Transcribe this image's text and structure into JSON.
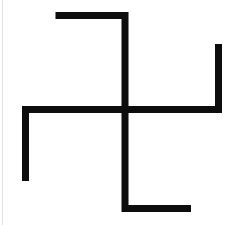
{
  "canvas": {
    "width": 233,
    "height": 225,
    "background_color": "#ffffff",
    "title": "Swastika Symbol"
  },
  "symbol": {
    "name": "swastika",
    "orientation": "left-facing",
    "description": "Four-armed geometric cross symbol with bent arms",
    "stroke_color": "#0d0d0d",
    "stroke_width": 7,
    "center": {
      "x": 125,
      "y": 109.5
    },
    "arms": [
      {
        "id": "top-arm",
        "label": "Top arm bending left",
        "points": "125,109.5 125,15.5 55.5,15.5"
      },
      {
        "id": "right-arm",
        "label": "Right arm bending up",
        "points": "125,109.5 218.5,109.5 218.5,44"
      },
      {
        "id": "bottom-arm",
        "label": "Bottom arm bending right",
        "points": "125,109.5 125,208.5 191,208.5"
      },
      {
        "id": "left-arm",
        "label": "Left arm bending down",
        "points": "125,109.5 25.5,109.5 25.5,181"
      }
    ]
  },
  "artifacts": {
    "left_edge_line": {
      "label": "Faint scan edge line",
      "color": "#dcdcdc",
      "x": 2
    }
  }
}
